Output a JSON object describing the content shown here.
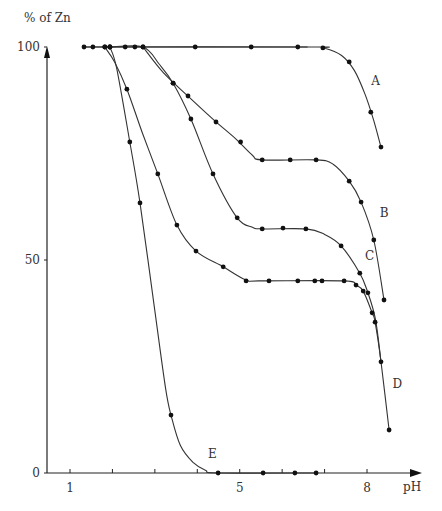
{
  "chart_data": {
    "type": "line",
    "title": "",
    "xlabel": "pH",
    "ylabel": "% of Zn",
    "xlim": [
      0.45,
      9.5
    ],
    "ylim": [
      0,
      100
    ],
    "x_ticks": [
      1,
      2,
      3,
      4,
      5,
      6,
      7,
      8
    ],
    "x_tick_labels": [
      {
        "value": 1,
        "label": "1"
      },
      {
        "value": 5,
        "label": "5"
      },
      {
        "value": 8,
        "label": "8"
      }
    ],
    "y_tick_labels": [
      {
        "value": 0,
        "label": "0"
      },
      {
        "value": 50,
        "label": "50"
      },
      {
        "value": 100,
        "label": "100"
      }
    ],
    "grid": false,
    "legend": "none (curves labelled inline A–E)",
    "series": [
      {
        "name": "A",
        "label_pos": {
          "x": 8.1,
          "y": 91
        },
        "points": [
          [
            1.33,
            100
          ],
          [
            1.54,
            100
          ],
          [
            1.82,
            100
          ],
          [
            1.94,
            100
          ],
          [
            2.3,
            100
          ],
          [
            2.53,
            100
          ],
          [
            2.72,
            100
          ],
          [
            3.95,
            100
          ],
          [
            5.27,
            100
          ],
          [
            6.37,
            100
          ],
          [
            6.96,
            99.8
          ],
          [
            7.58,
            96.5
          ],
          [
            8.09,
            84.7
          ],
          [
            8.33,
            76.5
          ]
        ],
        "curve": [
          [
            1.33,
            100
          ],
          [
            6.6,
            100
          ],
          [
            7.0,
            99.7
          ],
          [
            7.4,
            98
          ],
          [
            7.7,
            94.5
          ],
          [
            7.95,
            89
          ],
          [
            8.15,
            83
          ],
          [
            8.33,
            76.5
          ]
        ]
      },
      {
        "name": "B",
        "label_pos": {
          "x": 8.3,
          "y": 60
        },
        "points": [
          [
            2.72,
            100
          ],
          [
            3.43,
            91.5
          ],
          [
            3.78,
            88.5
          ],
          [
            4.44,
            82.4
          ],
          [
            5.02,
            77.7
          ],
          [
            5.53,
            73.5
          ],
          [
            6.19,
            73.5
          ],
          [
            6.8,
            73.5
          ],
          [
            7.58,
            68.5
          ],
          [
            7.86,
            63.6
          ],
          [
            8.16,
            54.7
          ],
          [
            8.4,
            40.6
          ]
        ],
        "curve": [
          [
            2.72,
            100
          ],
          [
            3.2,
            94
          ],
          [
            3.8,
            88.3
          ],
          [
            4.4,
            82.8
          ],
          [
            4.9,
            78.5
          ],
          [
            5.3,
            74.6
          ],
          [
            5.53,
            73.5
          ],
          [
            6.8,
            73.5
          ],
          [
            7.2,
            72.5
          ],
          [
            7.58,
            68.5
          ],
          [
            7.86,
            63.6
          ],
          [
            8.16,
            54.7
          ],
          [
            8.4,
            40.6
          ]
        ]
      },
      {
        "name": "C",
        "label_pos": {
          "x": 7.95,
          "y": 50
        },
        "points": [
          [
            1.94,
            100
          ],
          [
            3.43,
            91.5
          ],
          [
            3.85,
            83.1
          ],
          [
            4.37,
            70.2
          ],
          [
            4.94,
            59.9
          ],
          [
            5.53,
            57.3
          ],
          [
            6.02,
            57.5
          ],
          [
            6.56,
            57.3
          ],
          [
            7.39,
            53.3
          ],
          [
            7.83,
            46.9
          ],
          [
            8.02,
            42.3
          ]
        ],
        "curve": [
          [
            1.94,
            100
          ],
          [
            2.72,
            100
          ],
          [
            3.1,
            96
          ],
          [
            3.43,
            91.5
          ],
          [
            3.85,
            83.1
          ],
          [
            4.37,
            70.2
          ],
          [
            4.94,
            59.9
          ],
          [
            5.3,
            57.7
          ],
          [
            5.53,
            57.3
          ],
          [
            6.56,
            57.3
          ],
          [
            7.0,
            56
          ],
          [
            7.39,
            53.3
          ],
          [
            7.83,
            46.9
          ],
          [
            8.02,
            42.3
          ],
          [
            8.2,
            36
          ],
          [
            8.33,
            26.1
          ]
        ]
      },
      {
        "name": "D",
        "label_pos": {
          "x": 8.6,
          "y": 20
        },
        "points": [
          [
            1.82,
            100
          ],
          [
            2.34,
            90.1
          ],
          [
            3.07,
            70.2
          ],
          [
            3.52,
            58.2
          ],
          [
            3.97,
            52.1
          ],
          [
            4.61,
            48.4
          ],
          [
            5.15,
            45.1
          ],
          [
            5.69,
            45.1
          ],
          [
            6.37,
            45.1
          ],
          [
            6.77,
            45.1
          ],
          [
            6.94,
            45.1
          ],
          [
            7.46,
            45.1
          ],
          [
            7.74,
            44.1
          ],
          [
            7.91,
            42.7
          ],
          [
            8.12,
            37.6
          ],
          [
            8.19,
            35.4
          ],
          [
            8.33,
            26.1
          ],
          [
            8.52,
            10.1
          ]
        ],
        "curve": [
          [
            1.82,
            100
          ],
          [
            2.05,
            96.5
          ],
          [
            2.34,
            90.1
          ],
          [
            2.7,
            80
          ],
          [
            3.07,
            70.2
          ],
          [
            3.52,
            58.2
          ],
          [
            3.97,
            52.1
          ],
          [
            4.61,
            48.4
          ],
          [
            5.15,
            45.3
          ],
          [
            5.5,
            45.1
          ],
          [
            7.46,
            45.1
          ],
          [
            7.74,
            44.1
          ],
          [
            7.91,
            42.7
          ],
          [
            8.12,
            37.6
          ],
          [
            8.19,
            35.4
          ],
          [
            8.33,
            26.1
          ],
          [
            8.52,
            10.1
          ]
        ]
      },
      {
        "name": "E",
        "label_pos": {
          "x": 4.25,
          "y": 3.5
        },
        "points": [
          [
            1.94,
            100
          ],
          [
            2.41,
            77.7
          ],
          [
            2.65,
            63.4
          ],
          [
            3.38,
            13.6
          ],
          [
            4.49,
            0
          ],
          [
            5.55,
            0
          ],
          [
            6.3,
            0
          ],
          [
            6.8,
            0
          ]
        ],
        "curve": [
          [
            1.94,
            100
          ],
          [
            2.1,
            95
          ],
          [
            2.41,
            77.7
          ],
          [
            2.65,
            63.4
          ],
          [
            3.0,
            38
          ],
          [
            3.25,
            20
          ],
          [
            3.38,
            13.6
          ],
          [
            3.6,
            6.5
          ],
          [
            3.9,
            2.5
          ],
          [
            4.2,
            0.6
          ],
          [
            4.49,
            0
          ],
          [
            6.8,
            0
          ]
        ]
      }
    ]
  },
  "axes": {
    "y_label": "% of Zn",
    "x_label": "pH"
  }
}
